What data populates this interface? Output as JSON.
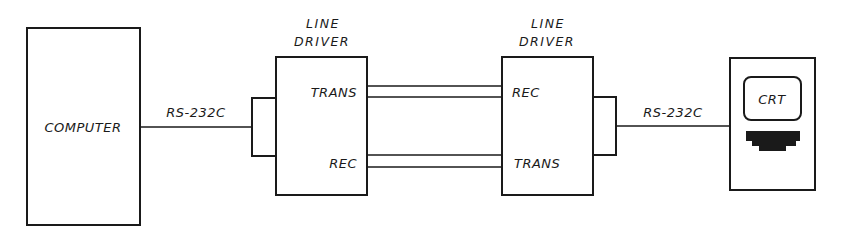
{
  "diagram": {
    "type": "block-diagram",
    "nodes": {
      "computer": {
        "label": "COMPUTER"
      },
      "line_driver_left": {
        "title_line1": "LINE",
        "title_line2": "DRIVER",
        "port_top": "TRANS",
        "port_bottom": "REC"
      },
      "line_driver_right": {
        "title_line1": "LINE",
        "title_line2": "DRIVER",
        "port_top": "REC",
        "port_bottom": "TRANS"
      },
      "terminal": {
        "screen_label": "CRT"
      }
    },
    "links": {
      "left_serial": {
        "label": "RS-232C"
      },
      "right_serial": {
        "label": "RS-232C"
      }
    },
    "edges": [
      {
        "from": "computer",
        "to": "line_driver_left",
        "label": "RS-232C"
      },
      {
        "from": "line_driver_left.TRANS",
        "to": "line_driver_right.REC",
        "label": ""
      },
      {
        "from": "line_driver_right.TRANS",
        "to": "line_driver_left.REC",
        "label": ""
      },
      {
        "from": "line_driver_right",
        "to": "terminal",
        "label": "RS-232C"
      }
    ],
    "colors": {
      "stroke": "#1a1a1a",
      "background": "#ffffff"
    }
  }
}
